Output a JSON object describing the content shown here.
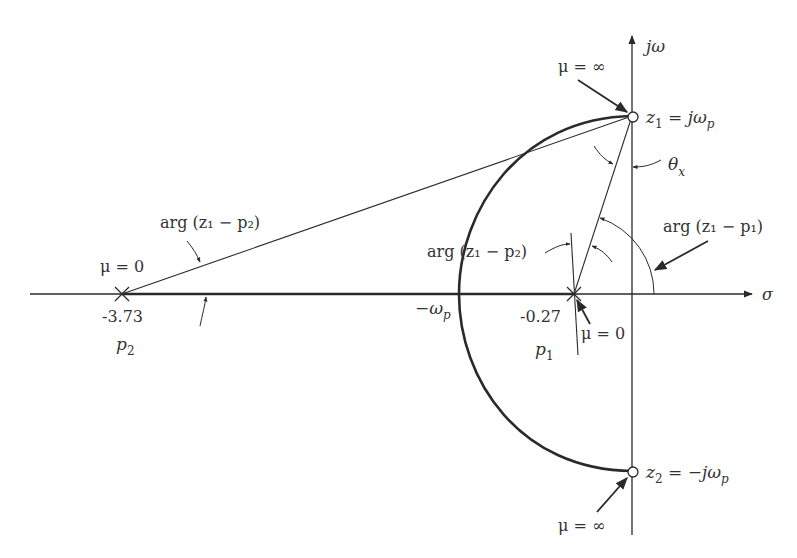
{
  "diagram": {
    "axes": {
      "imag_axis_label": "jω",
      "real_axis_label": "σ"
    },
    "poles": [
      {
        "name": "p1",
        "label": "p",
        "sub": "1",
        "value": "-0.27",
        "gain_label": "μ = 0"
      },
      {
        "name": "p2",
        "label": "p",
        "sub": "2",
        "value": "-3.73",
        "gain_label": "μ = 0"
      }
    ],
    "zeros": [
      {
        "name": "z1",
        "label_main": "z",
        "sub": "1",
        "label_rest": " = jω",
        "rest_sub": "p",
        "gain_label": "μ = ∞"
      },
      {
        "name": "z2",
        "label_main": "z",
        "sub": "2",
        "label_rest": " = −jω",
        "rest_sub": "p",
        "gain_label": "μ = ∞"
      }
    ],
    "circle_crossing_label": "−ω",
    "circle_crossing_sub": "p",
    "angle_labels": {
      "theta": "θ",
      "theta_sub": "x",
      "arg_z1_p2_left": "arg (z₁ − p₂)",
      "arg_z1_p2_mid": "arg (z₁ − p₂)",
      "arg_z1_p1": "arg (z₁ − p₁)"
    },
    "colors": {
      "ink": "#2a2a2a",
      "background": "#ffffff"
    }
  }
}
